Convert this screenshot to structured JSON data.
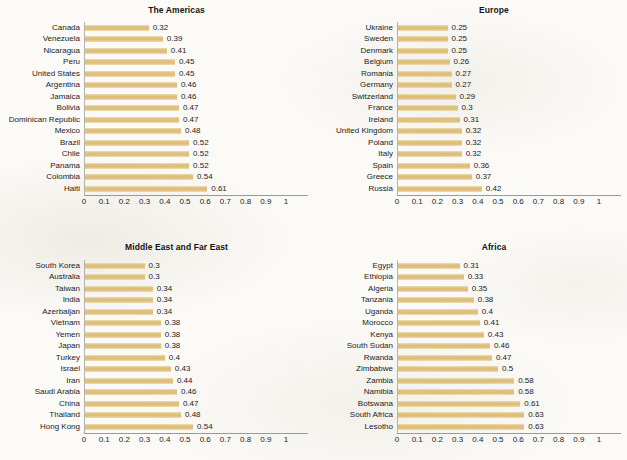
{
  "figure": {
    "bar_color": "#dcbc72",
    "axis_color": "#9a9a9a",
    "text_color": "#1b1b1b",
    "background_color": "#fbfaf7"
  },
  "chart_data": [
    {
      "type": "bar",
      "orientation": "horizontal",
      "title": "The Americas",
      "xlabel": "",
      "ylabel": "",
      "xlim": [
        0,
        1
      ],
      "xticks": [
        "0",
        "0.1",
        "0.2",
        "0.3",
        "0.4",
        "0.5",
        "0.6",
        "0.7",
        "0.8",
        "0.9",
        "1"
      ],
      "grid": false,
      "legend": "none",
      "categories": [
        "Canada",
        "Venezuela",
        "Nicaragua",
        "Peru",
        "United States",
        "Argentina",
        "Jamaica",
        "Bolivia",
        "Dominican Republic",
        "Mexico",
        "Brazil",
        "Chile",
        "Panama",
        "Colombia",
        "Haiti"
      ],
      "values": [
        0.32,
        0.39,
        0.41,
        0.45,
        0.45,
        0.46,
        0.46,
        0.47,
        0.47,
        0.48,
        0.52,
        0.52,
        0.52,
        0.54,
        0.61
      ],
      "value_labels": [
        "0.32",
        "0.39",
        "0.41",
        "0.45",
        "0.45",
        "0.46",
        "0.46",
        "0.47",
        "0.47",
        "0.48",
        "0.52",
        "0.52",
        "0.52",
        "0.54",
        "0.61"
      ]
    },
    {
      "type": "bar",
      "orientation": "horizontal",
      "title": "Europe",
      "xlabel": "",
      "ylabel": "",
      "xlim": [
        0,
        1
      ],
      "xticks": [
        "0",
        "0.1",
        "0.2",
        "0.3",
        "0.4",
        "0.5",
        "0.6",
        "0.7",
        "0.8",
        "0.9",
        "1"
      ],
      "grid": false,
      "legend": "none",
      "categories": [
        "Ukraine",
        "Sweden",
        "Denmark",
        "Belgium",
        "Romania",
        "Germany",
        "Switzerland",
        "France",
        "Ireland",
        "United Kingdom",
        "Poland",
        "Italy",
        "Spain",
        "Greece",
        "Russia"
      ],
      "values": [
        0.25,
        0.25,
        0.25,
        0.26,
        0.27,
        0.27,
        0.29,
        0.3,
        0.31,
        0.32,
        0.32,
        0.32,
        0.36,
        0.37,
        0.42
      ],
      "value_labels": [
        "0.25",
        "0.25",
        "0.25",
        "0.26",
        "0.27",
        "0.27",
        "0.29",
        "0.3",
        "0.31",
        "0.32",
        "0.32",
        "0.32",
        "0.36",
        "0.37",
        "0.42"
      ]
    },
    {
      "type": "bar",
      "orientation": "horizontal",
      "title": "Middle East and Far East",
      "xlabel": "",
      "ylabel": "",
      "xlim": [
        0,
        1
      ],
      "xticks": [
        "0",
        "0.1",
        "0.2",
        "0.3",
        "0.4",
        "0.5",
        "0.6",
        "0.7",
        "0.8",
        "0.9",
        "1"
      ],
      "grid": false,
      "legend": "none",
      "categories": [
        "South Korea",
        "Australia",
        "Taiwan",
        "India",
        "Azerbaijan",
        "Vietnam",
        "Yemen",
        "Japan",
        "Turkey",
        "Israel",
        "Iran",
        "Saudi Arabia",
        "China",
        "Thailand",
        "Hong Kong"
      ],
      "values": [
        0.3,
        0.3,
        0.34,
        0.34,
        0.34,
        0.38,
        0.38,
        0.38,
        0.4,
        0.43,
        0.44,
        0.46,
        0.47,
        0.48,
        0.54
      ],
      "value_labels": [
        "0.3",
        "0.3",
        "0.34",
        "0.34",
        "0.34",
        "0.38",
        "0.38",
        "0.38",
        "0.4",
        "0.43",
        "0.44",
        "0.46",
        "0.47",
        "0.48",
        "0.54"
      ]
    },
    {
      "type": "bar",
      "orientation": "horizontal",
      "title": "Africa",
      "xlabel": "",
      "ylabel": "",
      "xlim": [
        0,
        1
      ],
      "xticks": [
        "0",
        "0.1",
        "0.2",
        "0.3",
        "0.4",
        "0.5",
        "0.6",
        "0.7",
        "0.8",
        "0.9",
        "1"
      ],
      "grid": false,
      "legend": "none",
      "categories": [
        "Egypt",
        "Ethiopia",
        "Algeria",
        "Tanzania",
        "Uganda",
        "Morocco",
        "Kenya",
        "South Sudan",
        "Rwanda",
        "Zimbabwe",
        "Zambia",
        "Namibia",
        "Botswana",
        "South Africa",
        "Lesotho"
      ],
      "values": [
        0.31,
        0.33,
        0.35,
        0.38,
        0.4,
        0.41,
        0.43,
        0.46,
        0.47,
        0.5,
        0.58,
        0.58,
        0.61,
        0.63,
        0.63
      ],
      "value_labels": [
        "0.31",
        "0.33",
        "0.35",
        "0.38",
        "0.4",
        "0.41",
        "0.43",
        "0.46",
        "0.47",
        "0.5",
        "0.58",
        "0.58",
        "0.61",
        "0.63",
        "0.63"
      ]
    }
  ]
}
